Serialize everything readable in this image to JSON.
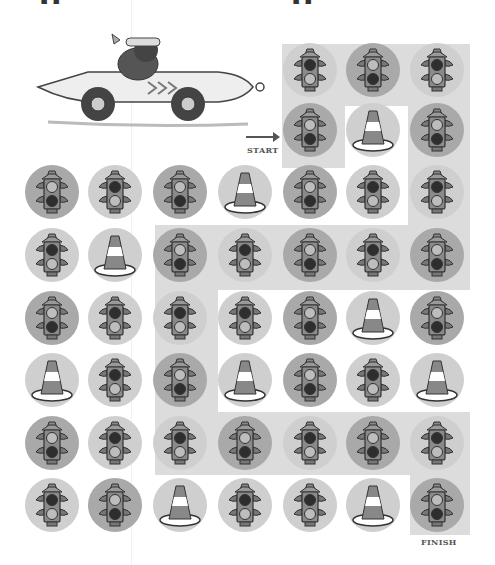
{
  "title_fragment": "g   ,              g",
  "labels": {
    "start": "START",
    "finish": "FINISH"
  },
  "colors": {
    "path_shade": "#dcdcdc",
    "circle_dark": "#a9a9a9",
    "circle_light": "#cfcfcf",
    "ink": "#444444"
  },
  "legend": {
    "T": "traffic light, top light lit",
    "B": "traffic light, bottom light lit",
    "C": "traffic cone"
  },
  "grid": {
    "columns_x": [
      52,
      115,
      180,
      245,
      310,
      373,
      437
    ],
    "rows_y": [
      70,
      130,
      192,
      255,
      318,
      380,
      443,
      505
    ],
    "rows": [
      [
        null,
        null,
        null,
        null,
        "B-l",
        "T-d",
        "B-l"
      ],
      [
        null,
        null,
        null,
        null,
        "T-d",
        "C-l",
        "T-d"
      ],
      [
        "T-d",
        "B-l",
        "T-d",
        "C-l",
        "T-d",
        "B-l",
        "B-l"
      ],
      [
        "B-l",
        "C-l",
        "T-d",
        "B-l",
        "T-d",
        "B-l",
        "T-d"
      ],
      [
        "T-d",
        "B-l",
        "B-l",
        "B-l",
        "T-d",
        "C-l",
        "T-d"
      ],
      [
        "C-l",
        "B-l",
        "T-d",
        "C-l",
        "T-d",
        "B-l",
        "C-l"
      ],
      [
        "T-d",
        "B-l",
        "B-l",
        "T-d",
        "B-l",
        "T-d",
        "B-l"
      ],
      [
        "B-l",
        "T-d",
        "C-l",
        "B-l",
        "B-l",
        "C-l",
        "T-d"
      ]
    ]
  }
}
